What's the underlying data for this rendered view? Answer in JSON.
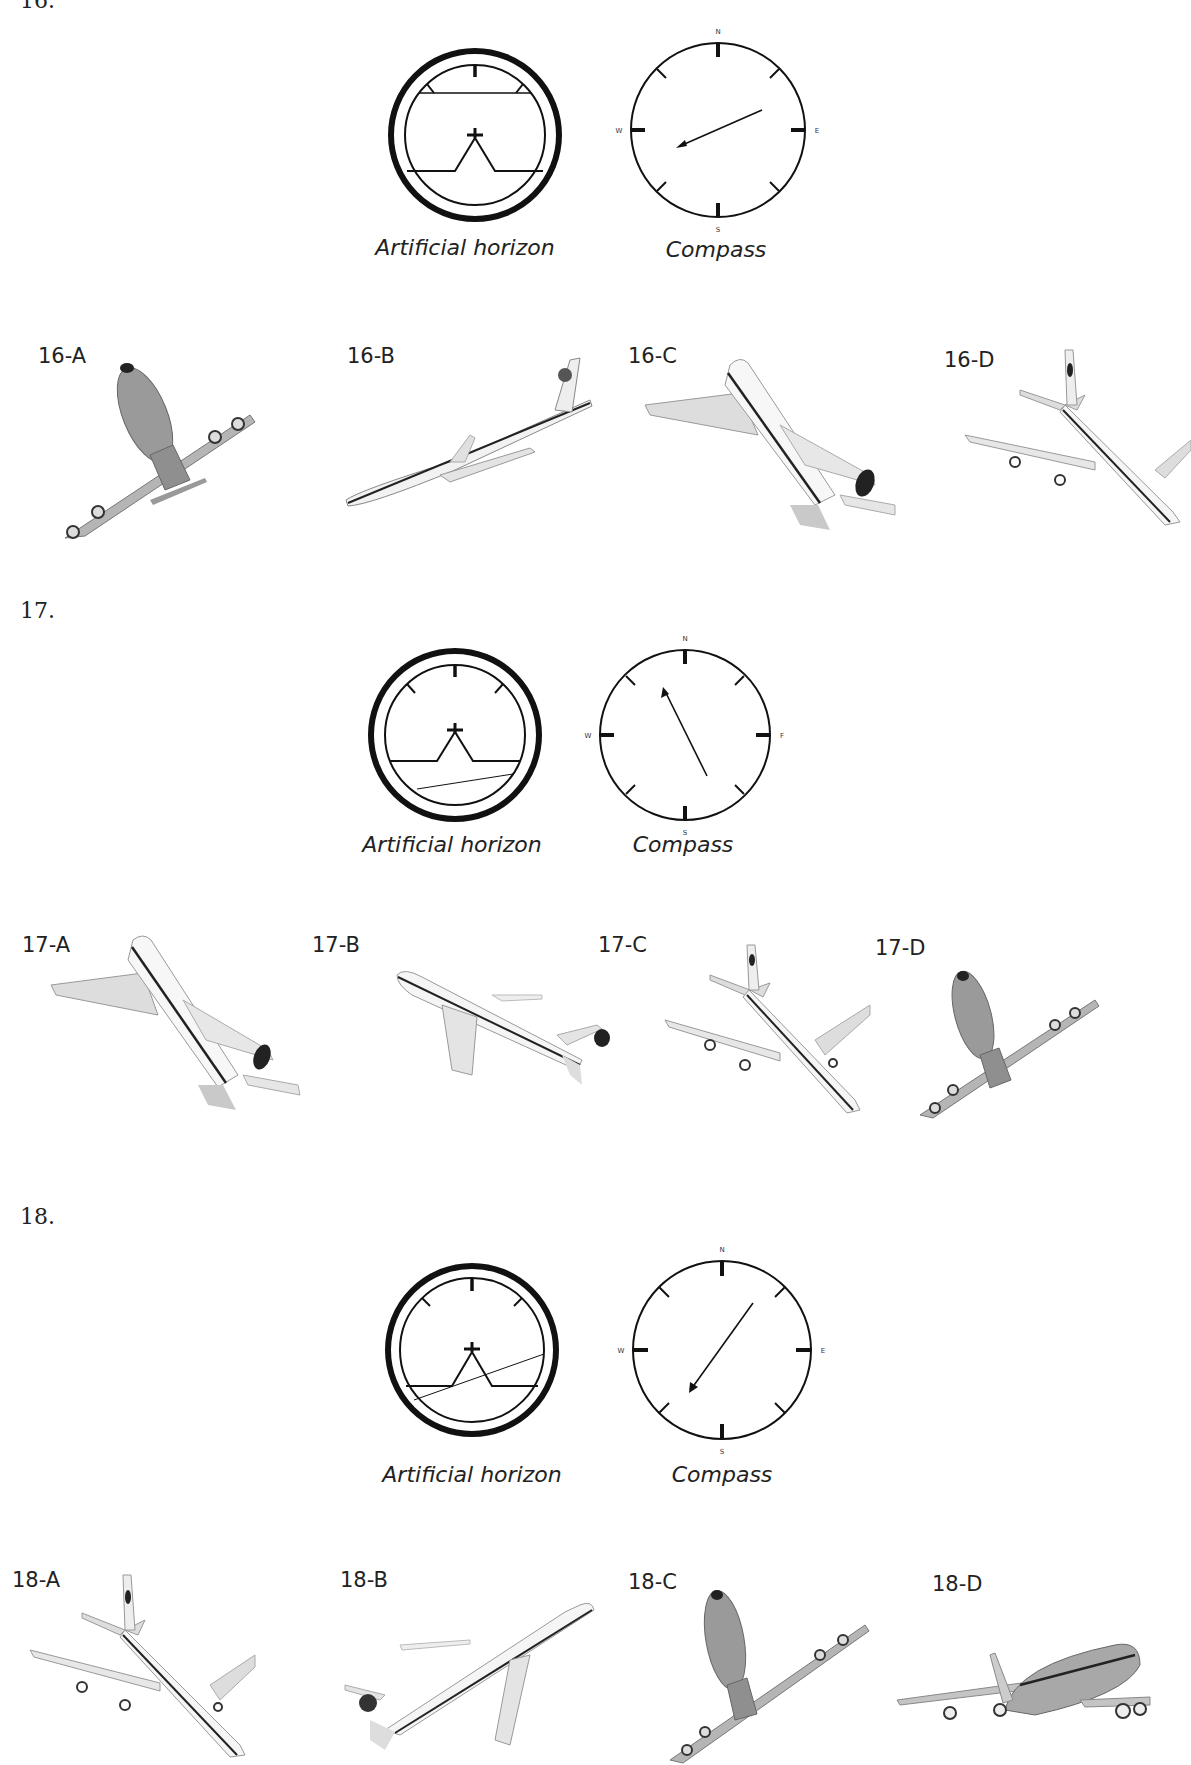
{
  "questions": [
    {
      "number": "16.",
      "artificial_horizon": {
        "caption": "Artificial horizon",
        "horizon_line": "level-high",
        "bank": "none"
      },
      "compass": {
        "caption": "Compass",
        "labels": {
          "n": "N",
          "e": "E",
          "s": "S",
          "w": "W"
        },
        "heading": "west-southwest"
      },
      "options": [
        {
          "label": "16-A",
          "image": "airplane-front-view-climbing-banked"
        },
        {
          "label": "16-B",
          "image": "airplane-side-view-left-descending"
        },
        {
          "label": "16-C",
          "image": "airplane-rear-view-climbing-left"
        },
        {
          "label": "16-D",
          "image": "airplane-top-view-descending-right"
        }
      ]
    },
    {
      "number": "17.",
      "artificial_horizon": {
        "caption": "Artificial horizon",
        "horizon_line": "low-tilted",
        "bank": "slight"
      },
      "compass": {
        "caption": "Compass",
        "labels": {
          "n": "N",
          "e": "F",
          "s": "S",
          "w": "W"
        },
        "heading": "north-northwest"
      },
      "options": [
        {
          "label": "17-A",
          "image": "airplane-rear-view-climbing-left"
        },
        {
          "label": "17-B",
          "image": "airplane-side-view-descending-left"
        },
        {
          "label": "17-C",
          "image": "airplane-top-view-descending-right"
        },
        {
          "label": "17-D",
          "image": "airplane-front-view-climbing-banked"
        }
      ]
    },
    {
      "number": "18.",
      "artificial_horizon": {
        "caption": "Artificial horizon",
        "horizon_line": "mid-tilted",
        "bank": "left"
      },
      "compass": {
        "caption": "Compass",
        "labels": {
          "n": "N",
          "e": "E",
          "s": "S",
          "w": "W"
        },
        "heading": "southwest"
      },
      "options": [
        {
          "label": "18-A",
          "image": "airplane-top-view-descending-right"
        },
        {
          "label": "18-B",
          "image": "airplane-side-view-climbing-right"
        },
        {
          "label": "18-C",
          "image": "airplane-front-view-climbing-banked"
        },
        {
          "label": "18-D",
          "image": "airplane-front-view-level-banked"
        }
      ]
    }
  ]
}
